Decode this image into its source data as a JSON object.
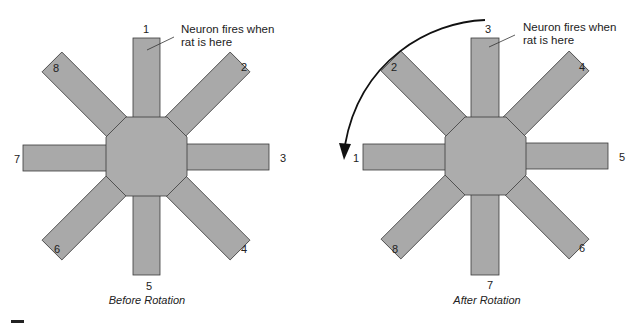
{
  "figure": {
    "panels": [
      {
        "caption": "Before Rotation",
        "annotation": "Neuron fires when rat is here",
        "annotation_line1": "Neuron fires when",
        "annotation_line2": "rat is here",
        "arm_labels": {
          "top": "1",
          "top_right": "2",
          "right": "3",
          "bottom_right": "4",
          "bottom": "5",
          "bottom_left": "6",
          "left": "7",
          "top_left": "8"
        }
      },
      {
        "caption": "After Rotation",
        "annotation": "Neuron fires when rat is here",
        "annotation_line1": "Neuron fires when",
        "annotation_line2": "rat is here",
        "arm_labels": {
          "top": "3",
          "top_right": "4",
          "right": "5",
          "bottom_right": "6",
          "bottom": "7",
          "bottom_left": "8",
          "left": "1",
          "top_left": "2"
        },
        "rotation_arrow": "counterclockwise arrow from top to left"
      }
    ],
    "colors": {
      "maze_fill": "#a9a9a9",
      "outline": "#3a3a3a",
      "background": "#ffffff"
    }
  }
}
